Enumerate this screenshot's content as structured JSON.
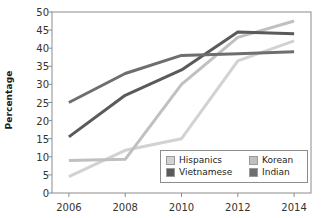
{
  "chart_data": {
    "type": "line",
    "title": "",
    "xlabel": "",
    "ylabel": "Percentage",
    "x": [
      2006,
      2008,
      2010,
      2012,
      2014
    ],
    "xticklabels": [
      "2006",
      "2008",
      "2010",
      "2012",
      "2014"
    ],
    "yticklabels": [
      "0",
      "5",
      "10",
      "15",
      "20",
      "25",
      "30",
      "35",
      "40",
      "45",
      "50"
    ],
    "yticks": [
      0,
      5,
      10,
      15,
      20,
      25,
      30,
      35,
      40,
      45,
      50
    ],
    "ylim": [
      0,
      50
    ],
    "xlim": [
      2005.4,
      2014.6
    ],
    "grid": false,
    "legend_position": "lower-right-inside",
    "series": [
      {
        "name": "Hispanics",
        "color": "#d2d2d2",
        "values": [
          4.5,
          11.8,
          15.0,
          36.5,
          42.0
        ]
      },
      {
        "name": "Korean",
        "color": "#c0c0c0",
        "values": [
          9.0,
          9.3,
          30.0,
          43.0,
          47.5
        ]
      },
      {
        "name": "Vietnamese",
        "color": "#5a5a5a",
        "values": [
          15.5,
          27.0,
          34.0,
          44.5,
          44.0
        ]
      },
      {
        "name": "Indian",
        "color": "#6e6e6e",
        "values": [
          25.0,
          33.0,
          38.0,
          38.5,
          39.0
        ]
      }
    ]
  },
  "legend": {
    "entries": [
      {
        "label": "Hispanics",
        "color": "#d2d2d2"
      },
      {
        "label": "Korean",
        "color": "#c0c0c0"
      },
      {
        "label": "Vietnamese",
        "color": "#5a5a5a"
      },
      {
        "label": "Indian",
        "color": "#6e6e6e"
      }
    ]
  },
  "axes": {
    "frame_color": "#8c8c8c",
    "tick_color": "#8c8c8c",
    "text_color": "#333333"
  }
}
